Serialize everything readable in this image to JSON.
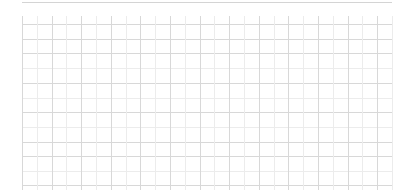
{
  "chart_data": {
    "type": "line",
    "title": "",
    "xlabel": "",
    "ylabel": "",
    "categories": [],
    "series": [],
    "grid": true,
    "legend": null,
    "plot_area": {
      "left": 22,
      "top": 16,
      "right": 392,
      "bottom": 190
    },
    "grid_lines": {
      "vertical_x": [
        22,
        36.8,
        51.6,
        66.4,
        81.2,
        96,
        110.8,
        125.6,
        140.4,
        155.2,
        170,
        184.8,
        199.6,
        214.4,
        229.2,
        244,
        258.8,
        273.6,
        288.4,
        303.2,
        318,
        332.8,
        347.6,
        362.4,
        377.2,
        392
      ],
      "horizontal_major_y": [
        24,
        39,
        53,
        83,
        112,
        142,
        156,
        185
      ],
      "horizontal_minor_y": [
        68,
        98,
        127,
        171
      ]
    },
    "colors": {
      "major": "#d8d8d8",
      "minor": "#ececec",
      "top_rule": "#d4d4d4",
      "background": "#ffffff"
    }
  }
}
